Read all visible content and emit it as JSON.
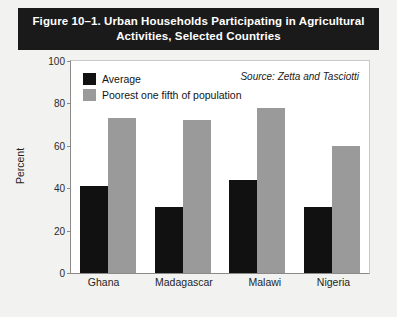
{
  "figure": {
    "title_line1": "Figure 10–1. Urban Households Participating in Agricultural",
    "title_line2": "Activities, Selected Countries",
    "source_note": "Source: Zetta and Tasciotti"
  },
  "colors": {
    "banner_bg": "#1a1a1a",
    "banner_text": "#ffffff",
    "average_bar": "#111111",
    "poorest_bar": "#9a9a9a",
    "page_bg": "#f2f2f0",
    "plot_bg": "#ffffff",
    "axis_line": "#8a8a8a"
  },
  "chart_data": {
    "type": "bar",
    "title": "Figure 10–1. Urban Households Participating in Agricultural Activities, Selected Countries",
    "categories": [
      "Ghana",
      "Madagascar",
      "Malawi",
      "Nigeria"
    ],
    "series": [
      {
        "name": "Average",
        "values": [
          41,
          31,
          44,
          31
        ],
        "color": "#111111"
      },
      {
        "name": "Poorest one fifth of population",
        "values": [
          73,
          72,
          78,
          60
        ],
        "color": "#9a9a9a"
      }
    ],
    "xlabel": "",
    "ylabel": "Percent",
    "ylim": [
      0,
      100
    ],
    "yticks": [
      0,
      20,
      40,
      60,
      80,
      100
    ],
    "grid": false,
    "legend_position": "top-left-inside",
    "annotations": [
      "Source: Zetta and Tasciotti"
    ]
  },
  "axis": {
    "y_label": "Percent",
    "y_ticks": [
      "100",
      "80",
      "60",
      "40",
      "20",
      "0"
    ]
  },
  "legend": {
    "items": [
      {
        "label": "Average"
      },
      {
        "label": "Poorest one fifth of population"
      }
    ]
  }
}
